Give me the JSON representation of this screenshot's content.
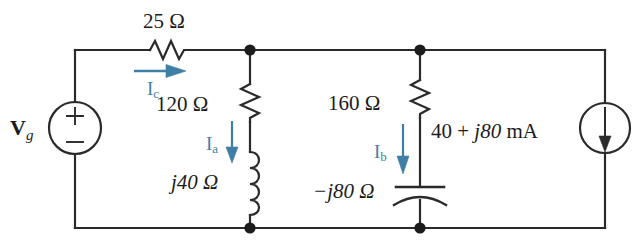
{
  "figure": {
    "type": "ac-circuit-schematic",
    "title": "",
    "colors": {
      "wire": "#2a2a2a",
      "label": "#1c1c1c",
      "current_arrow": "#3f7fa6",
      "background": "#ffffff"
    }
  },
  "sources": {
    "voltage": {
      "symbol": "circle-with-plus-minus",
      "name_main": "V",
      "name_sub": "g",
      "plus": "+",
      "minus": "−"
    },
    "current": {
      "symbol": "circle-with-down-arrow",
      "value": "40 + j80 mA",
      "value_real": "40",
      "value_operator": "+",
      "value_imag": "j80",
      "value_unit": "mA"
    }
  },
  "components": [
    {
      "id": "r25",
      "kind": "resistor",
      "label": "25 Ω",
      "orientation": "horizontal",
      "branch": "top"
    },
    {
      "id": "r120",
      "kind": "resistor",
      "label": "120 Ω",
      "orientation": "vertical",
      "branch": "middle"
    },
    {
      "id": "l40",
      "kind": "inductor",
      "label": "j40 Ω",
      "orientation": "vertical",
      "branch": "middle"
    },
    {
      "id": "r160",
      "kind": "resistor",
      "label": "160 Ω",
      "orientation": "vertical",
      "branch": "right"
    },
    {
      "id": "c80",
      "kind": "capacitor",
      "label": "−j80 Ω",
      "orientation": "vertical",
      "branch": "right"
    }
  ],
  "currents": [
    {
      "id": "Ic",
      "main": "I",
      "sub": "c",
      "direction": "right",
      "branch": "top"
    },
    {
      "id": "Ia",
      "main": "I",
      "sub": "a",
      "direction": "down",
      "branch": "middle"
    },
    {
      "id": "Ib",
      "main": "I",
      "sub": "b",
      "direction": "down",
      "branch": "right"
    }
  ],
  "nodes": [
    {
      "id": "node-top-middle",
      "x": 250,
      "y": 50
    },
    {
      "id": "node-bottom-middle",
      "x": 250,
      "y": 228
    },
    {
      "id": "node-top-right",
      "x": 420,
      "y": 50
    },
    {
      "id": "node-bottom-right",
      "x": 420,
      "y": 228
    }
  ]
}
